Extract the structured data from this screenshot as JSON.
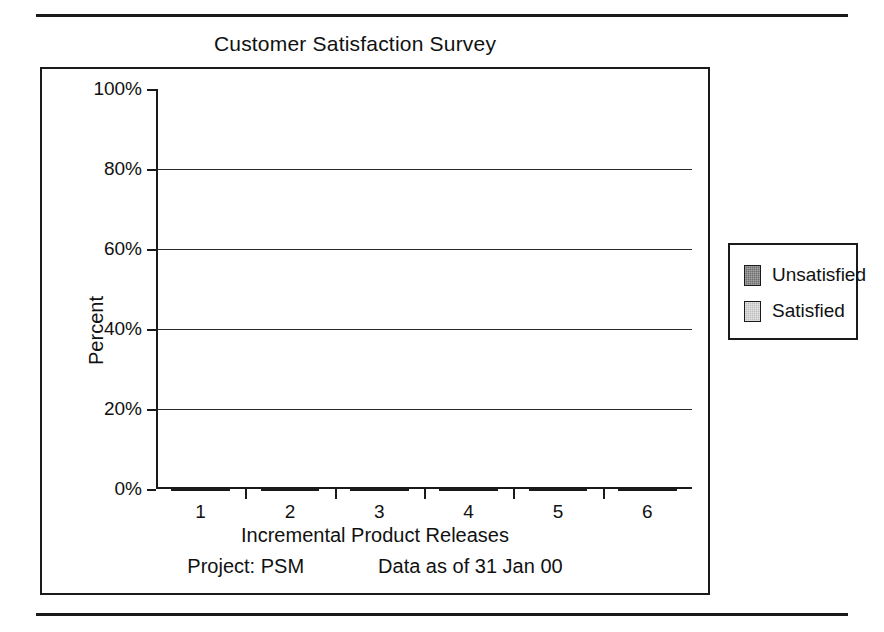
{
  "chart_data": {
    "type": "bar",
    "subtype": "stacked-bar-100pct",
    "title": "Customer Satisfaction Survey",
    "xlabel": "Incremental Product Releases",
    "ylabel": "Percent",
    "categories": [
      "1",
      "2",
      "3",
      "4",
      "5",
      "6"
    ],
    "series": [
      {
        "name": "Satisfied",
        "values": [
          56,
          75,
          91,
          93,
          96,
          91
        ]
      },
      {
        "name": "Unsatisfied",
        "values": [
          44,
          25,
          9,
          7,
          4,
          9
        ]
      }
    ],
    "stack_order_bottom_to_top": [
      "Satisfied",
      "Unsatisfied"
    ],
    "ylim": [
      0,
      100
    ],
    "ytick_labels": [
      "0%",
      "20%",
      "40%",
      "60%",
      "80%",
      "100%"
    ],
    "ytick_values": [
      0,
      20,
      40,
      60,
      80,
      100
    ],
    "grid": true,
    "legend_position": "right-outside",
    "colors": {
      "unsatisfied": "#6f6f6f",
      "satisfied": "#bcbcbc",
      "axis": "#1a1a1a",
      "text": "#111111",
      "background": "#ffffff"
    }
  },
  "legend": {
    "items": [
      {
        "label": "Unsatisfied",
        "swatch": "unsatisfied"
      },
      {
        "label": "Satisfied",
        "swatch": "satisfied"
      }
    ]
  },
  "footnotes": {
    "project": "Project: PSM",
    "data_as_of": "Data as of 31 Jan 00"
  }
}
